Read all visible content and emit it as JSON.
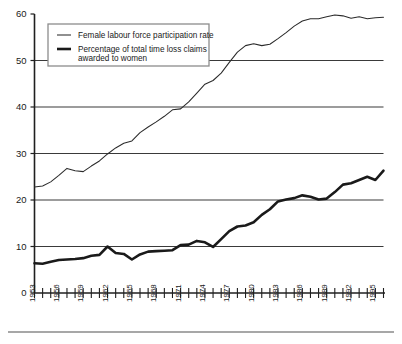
{
  "chart_data": {
    "type": "line",
    "title": "",
    "subtitle": "",
    "xlabel": "",
    "ylabel": "",
    "xlim": [
      1953,
      1996
    ],
    "ylim": [
      0,
      60
    ],
    "yticks": [
      0,
      10,
      20,
      30,
      40,
      50,
      60
    ],
    "grid": "horizontal",
    "legend_position": "top-left",
    "x": [
      1953,
      1954,
      1955,
      1956,
      1957,
      1958,
      1959,
      1960,
      1961,
      1962,
      1963,
      1964,
      1965,
      1966,
      1967,
      1968,
      1969,
      1970,
      1971,
      1972,
      1973,
      1974,
      1975,
      1976,
      1977,
      1978,
      1979,
      1980,
      1981,
      1982,
      1983,
      1984,
      1985,
      1986,
      1987,
      1988,
      1989,
      1990,
      1991,
      1992,
      1993,
      1994,
      1995,
      1996
    ],
    "xtick_labels": [
      "1953",
      "1956",
      "1959",
      "1962",
      "1965",
      "1968",
      "1971",
      "1974",
      "1977",
      "1980",
      "1983",
      "1986",
      "1989",
      "1992",
      "1995"
    ],
    "xtick_values": [
      1953,
      1956,
      1959,
      1962,
      1965,
      1968,
      1971,
      1974,
      1977,
      1980,
      1983,
      1986,
      1989,
      1992,
      1995
    ],
    "series": [
      {
        "name": "Female labour force participation rate",
        "style": "thin",
        "values": [
          22.8,
          23.0,
          23.9,
          25.3,
          26.8,
          26.3,
          26.1,
          27.3,
          28.4,
          29.9,
          31.2,
          32.2,
          32.7,
          34.5,
          35.7,
          36.8,
          38.0,
          39.4,
          39.6,
          41.1,
          43.0,
          44.9,
          45.7,
          47.3,
          49.6,
          51.8,
          53.2,
          53.6,
          53.2,
          53.5,
          54.7,
          56.0,
          57.4,
          58.5,
          59.0,
          59.0,
          59.4,
          59.8,
          59.6,
          59.1,
          59.4,
          59.0,
          59.2,
          59.3
        ]
      },
      {
        "name": "Percentage of total time loss claims awarded to women",
        "style": "thick",
        "values": [
          6.4,
          6.3,
          6.7,
          7.1,
          7.2,
          7.3,
          7.5,
          8.0,
          8.2,
          10.0,
          8.6,
          8.4,
          7.2,
          8.3,
          8.9,
          9.0,
          9.1,
          9.2,
          10.3,
          10.4,
          11.2,
          10.9,
          9.9,
          11.6,
          13.3,
          14.3,
          14.5,
          15.2,
          16.8,
          18.0,
          19.7,
          20.1,
          20.4,
          21.0,
          20.7,
          20.1,
          20.3,
          21.7,
          23.3,
          23.6,
          24.3,
          25.0,
          24.3,
          26.3
        ]
      }
    ]
  },
  "legend": {
    "items": [
      {
        "label": "Female labour force participation rate",
        "line2": ""
      },
      {
        "label": "Percentage of total time loss claims",
        "line2": "awarded to women"
      }
    ]
  },
  "colors": {
    "thin_series": "#2b2b2b",
    "thick_series": "#1a1a1a",
    "gridline": "#3a3a3a",
    "axis": "#1f1f1f",
    "legend_border": "#8d8d8d",
    "background": "#ffffff"
  }
}
